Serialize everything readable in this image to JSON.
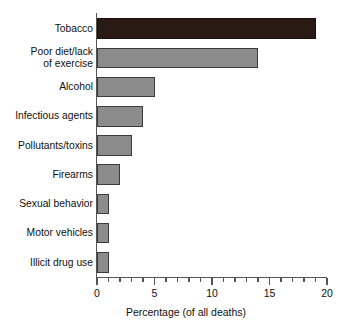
{
  "chart_data": {
    "type": "bar",
    "orientation": "horizontal",
    "title": "",
    "xlabel": "Percentage (of all deaths)",
    "ylabel": "",
    "xlim": [
      0,
      20
    ],
    "xticks": [
      0,
      5,
      10,
      15,
      20
    ],
    "xtick_labels": [
      "0",
      "5",
      "10",
      "15",
      "20"
    ],
    "minor_tick_interval": 1,
    "grid": false,
    "legend": null,
    "categories": [
      "Tobacco",
      "Poor diet/lack\nof exercise",
      "Alcohol",
      "Infectious agents",
      "Pollutants/toxins",
      "Firearms",
      "Sexual behavior",
      "Motor vehicles",
      "Illicit drug use"
    ],
    "values": [
      19,
      14,
      5,
      4,
      3,
      2,
      1,
      1,
      1
    ],
    "bar_colors": [
      "#2a1a14",
      "#8c8c8c",
      "#8c8c8c",
      "#8c8c8c",
      "#8c8c8c",
      "#8c8c8c",
      "#8c8c8c",
      "#8c8c8c",
      "#8c8c8c"
    ],
    "bar_edge_color": "#3a3a3a",
    "background_color": "#ffffff",
    "axis_color": "#555555"
  },
  "axis": {
    "x_title": "Percentage (of all deaths)"
  }
}
